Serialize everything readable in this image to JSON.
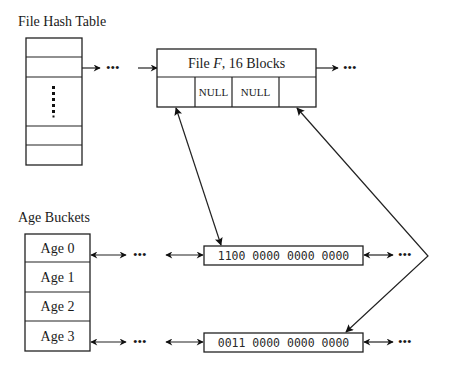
{
  "hash_table": {
    "title": "File Hash Table",
    "row_count": 6,
    "ellipsis": "vertical-dots"
  },
  "file_record": {
    "title_prefix": "File ",
    "title_var": "F",
    "title_suffix": ", 16 Blocks",
    "cells": [
      "",
      "NULL",
      "NULL",
      ""
    ]
  },
  "age_buckets": {
    "title": "Age Buckets",
    "rows": [
      {
        "label": "Age 0"
      },
      {
        "label": "Age 1"
      },
      {
        "label": "Age 2"
      },
      {
        "label": "Age 3"
      }
    ]
  },
  "bitmaps": [
    {
      "bits": "1100 0000 0000 0000",
      "bucket": "Age 0"
    },
    {
      "bits": "0011 0000 0000 0000",
      "bucket": "Age 3"
    }
  ],
  "ellipsis_glyph": "•••",
  "colors": {
    "line": "#222222",
    "background": "#ffffff"
  }
}
